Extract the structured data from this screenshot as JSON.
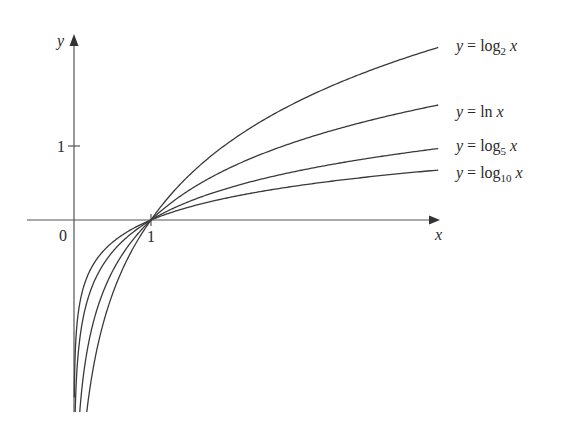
{
  "chart_data": {
    "type": "line",
    "title": "",
    "xlabel": "x",
    "ylabel": "y",
    "x_ticks": [
      "0",
      "1"
    ],
    "y_ticks": [
      "1"
    ],
    "xlim": [
      -0.6,
      4.9
    ],
    "ylim": [
      -2.6,
      2.5
    ],
    "grid": false,
    "legend_position": "inline-right",
    "series": [
      {
        "name": "y = log2 x",
        "label_main": "y = log",
        "label_sub": "2",
        "label_var": " x",
        "base": 2
      },
      {
        "name": "y = ln x",
        "label_main": "y = ln",
        "label_sub": "",
        "label_var": " x",
        "base": 2.718281828
      },
      {
        "name": "y = log5 x",
        "label_main": "y = log",
        "label_sub": "5",
        "label_var": " x",
        "base": 5
      },
      {
        "name": "y = log10 x",
        "label_main": "y = log",
        "label_sub": "10",
        "label_var": " x",
        "base": 10
      }
    ],
    "sample_points": {
      "x": [
        0.25,
        0.5,
        1,
        2,
        3,
        4,
        4.73
      ],
      "log2": [
        -2,
        -1,
        0,
        1,
        1.585,
        2,
        2.24
      ],
      "ln": [
        -1.386,
        -0.693,
        0,
        0.693,
        1.099,
        1.386,
        1.554
      ],
      "log5": [
        -0.861,
        -0.431,
        0,
        0.431,
        0.683,
        0.861,
        0.966
      ],
      "log10": [
        -0.602,
        -0.301,
        0,
        0.301,
        0.477,
        0.602,
        0.675
      ]
    },
    "color": "#3a3a3a"
  }
}
